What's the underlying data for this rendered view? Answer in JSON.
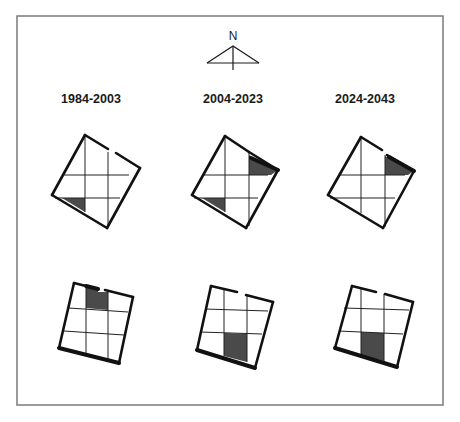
{
  "figure": {
    "frame": {
      "x": 17,
      "y": 16,
      "width": 426,
      "height": 389
    },
    "north_arrow": {
      "label": "N",
      "label_pos": [
        233,
        40
      ],
      "apex": [
        233,
        46
      ],
      "base_left": [
        207,
        63
      ],
      "base_right": [
        259,
        63
      ],
      "stem_bottom": [
        233,
        70
      ]
    },
    "period_labels": [
      {
        "text": "1984-2003",
        "x": 91,
        "y": 103
      },
      {
        "text": "2004-2023",
        "x": 233,
        "y": 103
      },
      {
        "text": "2024-2043",
        "x": 365,
        "y": 103
      }
    ],
    "colors": {
      "outline": "#111111",
      "shade": "#4a4a4a",
      "frame": "#7a7a7a"
    },
    "rows": [
      {
        "name": "upper-row-rotated-plan",
        "panels": [
          {
            "period": "1984-2003",
            "outline_segments": [
              [
                [
                  85,
                  135
                ],
                [
                  108,
                  149
                ]
              ],
              [
                [
                  116,
                  153
                ],
                [
                  140,
                  168
                ]
              ],
              [
                [
                  140,
                  168
                ],
                [
                  107,
                  228
                ]
              ],
              [
                [
                  107,
                  228
                ],
                [
                  52,
                  195
                ]
              ],
              [
                [
                  52,
                  195
                ],
                [
                  85,
                  135
                ]
              ]
            ],
            "thick_segments": [],
            "grid_lines": [
              [
                [
                  85,
                  135
                ],
                [
                  85,
                  212
                ]
              ],
              [
                [
                  108,
                  152
                ],
                [
                  108,
                  226
                ]
              ],
              [
                [
                  63,
                  175
                ],
                [
                  129,
                  175
                ]
              ],
              [
                [
                  55,
                  198
                ],
                [
                  120,
                  198
                ]
              ]
            ],
            "shaded": [
              [
                [
                  62,
                  198
                ],
                [
                  85,
                  198
                ],
                [
                  85,
                  212
                ]
              ]
            ]
          },
          {
            "period": "2004-2023",
            "outline_segments": [
              [
                [
                  225,
                  136
                ],
                [
                  249,
                  152
                ]
              ],
              [
                [
                  249,
                  152
                ],
                [
                  278,
                  170
                ]
              ],
              [
                [
                  278,
                  170
                ],
                [
                  246,
                  228
                ]
              ],
              [
                [
                  246,
                  228
                ],
                [
                  192,
                  195
                ]
              ],
              [
                [
                  192,
                  195
                ],
                [
                  225,
                  136
                ]
              ]
            ],
            "thick_segments": [
              [
                [
                  251,
                  158
                ],
                [
                  278,
                  170
                ]
              ]
            ],
            "grid_lines": [
              [
                [
                  225,
                  136
                ],
                [
                  225,
                  212
                ]
              ],
              [
                [
                  249,
                  152
                ],
                [
                  249,
                  226
                ]
              ],
              [
                [
                  203,
                  175
                ],
                [
                  268,
                  175
                ]
              ],
              [
                [
                  194,
                  198
                ],
                [
                  258,
                  198
                ]
              ]
            ],
            "shaded": [
              [
                [
                  202,
                  198
                ],
                [
                  225,
                  198
                ],
                [
                  225,
                  212
                ]
              ],
              [
                [
                  249,
                  155
                ],
                [
                  278,
                  170
                ],
                [
                  271,
                  175
                ],
                [
                  249,
                  175
                ]
              ]
            ]
          },
          {
            "period": "2024-2043",
            "outline_segments": [
              [
                [
                  361,
                  137
                ],
                [
                  382,
                  150
                ]
              ],
              [
                [
                  387,
                  155
                ],
                [
                  414,
                  171
                ]
              ],
              [
                [
                  414,
                  171
                ],
                [
                  383,
                  228
                ]
              ],
              [
                [
                  383,
                  228
                ],
                [
                  328,
                  195
                ]
              ],
              [
                [
                  328,
                  195
                ],
                [
                  361,
                  137
                ]
              ]
            ],
            "thick_segments": [
              [
                [
                  389,
                  157
                ],
                [
                  414,
                  171
                ]
              ]
            ],
            "grid_lines": [
              [
                [
                  361,
                  137
                ],
                [
                  361,
                  213
                ]
              ],
              [
                [
                  385,
                  155
                ],
                [
                  385,
                  227
                ]
              ],
              [
                [
                  340,
                  175
                ],
                [
                  405,
                  175
                ]
              ],
              [
                [
                  330,
                  198
                ],
                [
                  395,
                  198
                ]
              ]
            ],
            "shaded": [
              [
                [
                  385,
                  156
                ],
                [
                  414,
                  171
                ],
                [
                  408,
                  175
                ],
                [
                  385,
                  175
                ]
              ]
            ]
          }
        ]
      },
      {
        "name": "lower-row-plan",
        "panels": [
          {
            "period": "1984-2003",
            "outline_segments": [
              [
                [
                  74,
                  283
                ],
                [
                  98,
                  289
                ]
              ],
              [
                [
                  105,
                  290
                ],
                [
                  133,
                  297
                ]
              ],
              [
                [
                  133,
                  297
                ],
                [
                  119,
                  363
                ]
              ],
              [
                [
                  119,
                  363
                ],
                [
                  59,
                  348
                ]
              ],
              [
                [
                  59,
                  348
                ],
                [
                  74,
                  283
                ]
              ]
            ],
            "thick_segments": [
              [
                [
                  86,
                  286
                ],
                [
                  98,
                  289
                ]
              ],
              [
                [
                  59,
                  348
                ],
                [
                  119,
                  363
                ]
              ]
            ],
            "grid_lines": [
              [
                [
                  86,
                  286
                ],
                [
                  86,
                  356
                ]
              ],
              [
                [
                  108,
                  291
                ],
                [
                  108,
                  361
                ]
              ],
              [
                [
                  69,
                  308
                ],
                [
                  128,
                  312
                ]
              ],
              [
                [
                  64,
                  331
                ],
                [
                  124,
                  335
                ]
              ]
            ],
            "shaded": [
              [
                [
                  86,
                  286
                ],
                [
                  98,
                  289
                ],
                [
                  98,
                  292
                ],
                [
                  108,
                  292
                ],
                [
                  108,
                  310
                ],
                [
                  86,
                  308
                ]
              ]
            ]
          },
          {
            "period": "2004-2023",
            "outline_segments": [
              [
                [
                  211,
                  286
                ],
                [
                  237,
                  292
                ]
              ],
              [
                [
                  246,
                  295
                ],
                [
                  273,
                  302
                ]
              ],
              [
                [
                  273,
                  302
                ],
                [
                  255,
                  368
                ]
              ],
              [
                [
                  255,
                  368
                ],
                [
                  197,
                  350
                ]
              ],
              [
                [
                  197,
                  350
                ],
                [
                  211,
                  286
                ]
              ]
            ],
            "thick_segments": [
              [
                [
                  197,
                  350
                ],
                [
                  255,
                  368
                ]
              ]
            ],
            "grid_lines": [
              [
                [
                  224,
                  290
                ],
                [
                  224,
                  356
                ]
              ],
              [
                [
                  247,
                  295
                ],
                [
                  247,
                  362
                ]
              ],
              [
                [
                  205,
                  309
                ],
                [
                  268,
                  311
                ]
              ],
              [
                [
                  200,
                  332
                ],
                [
                  262,
                  334
                ]
              ]
            ],
            "shaded": [
              [
                [
                  224,
                  333
                ],
                [
                  247,
                  334
                ],
                [
                  247,
                  362
                ],
                [
                  224,
                  356
                ]
              ]
            ]
          },
          {
            "period": "2024-2043",
            "outline_segments": [
              [
                [
                  352,
                  286
                ],
                [
                  376,
                  292
                ]
              ],
              [
                [
                  385,
                  294
                ],
                [
                  413,
                  302
                ]
              ],
              [
                [
                  413,
                  302
                ],
                [
                  397,
                  367
                ]
              ],
              [
                [
                  397,
                  367
                ],
                [
                  335,
                  348
                ]
              ],
              [
                [
                  335,
                  348
                ],
                [
                  352,
                  286
                ]
              ]
            ],
            "thick_segments": [
              [
                [
                  335,
                  348
                ],
                [
                  397,
                  367
                ]
              ]
            ],
            "grid_lines": [
              [
                [
                  361,
                  289
                ],
                [
                  361,
                  355
                ]
              ],
              [
                [
                  384,
                  294
                ],
                [
                  384,
                  361
                ]
              ],
              [
                [
                  344,
                  308
                ],
                [
                  409,
                  310
                ]
              ],
              [
                [
                  339,
                  331
                ],
                [
                  403,
                  334
                ]
              ]
            ],
            "shaded": [
              [
                [
                  361,
                  332
                ],
                [
                  384,
                  333
                ],
                [
                  384,
                  361
                ],
                [
                  361,
                  355
                ]
              ]
            ]
          }
        ]
      }
    ]
  }
}
